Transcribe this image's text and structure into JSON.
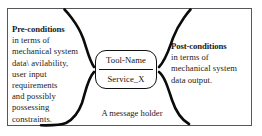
{
  "diagram": {
    "title": "A message holder",
    "frame": {
      "border_color": "#54585c",
      "background": "#ffffff"
    },
    "pre_conditions": {
      "heading": "Pre-conditions",
      "lines": [
        "in terms of",
        "mechanical system",
        "data\\ avilability,",
        "user input",
        "requirements",
        "and possibly",
        "possessing",
        "constraints."
      ]
    },
    "post_conditions": {
      "heading": "Post-conditions",
      "lines": [
        "in terms of",
        "mechanical system",
        "data output."
      ]
    },
    "tool_node": {
      "name": "Tool-Name",
      "service": "Service_X",
      "border_color": "#111111"
    },
    "caption": "A message holder",
    "brace_color": "#0b0b0b"
  }
}
